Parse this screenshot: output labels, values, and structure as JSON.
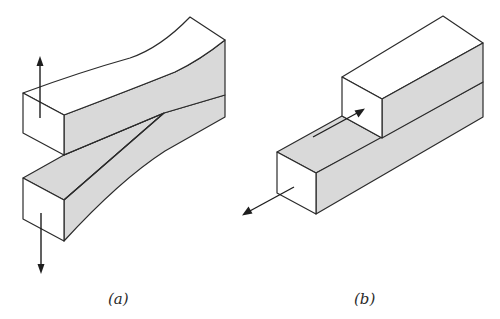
{
  "figure": {
    "panels": [
      {
        "id": "a",
        "label": "(a)",
        "description": "Mode I opening: cracked block with upper and lower arms pulled apart vertically",
        "arrows": [
          "up",
          "down"
        ]
      },
      {
        "id": "b",
        "label": "(b)",
        "description": "Mode II sliding: upper block slides relative to lower block along crack plane",
        "arrows": [
          "forward-along-crack",
          "backward-along-crack"
        ]
      }
    ],
    "colors": {
      "edge": "#2b2b2b",
      "shaded_face": "#d9d9d9",
      "white_face": "#ffffff",
      "background": "#ffffff"
    }
  }
}
